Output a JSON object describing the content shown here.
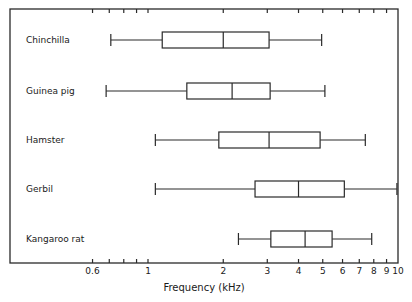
{
  "chart_data": {
    "type": "boxplot",
    "title": "",
    "xlabel": "Frequency (kHz)",
    "ylabel": "",
    "xscale": "log",
    "xlim": [
      0.45,
      10
    ],
    "grid": false,
    "legend": null,
    "x_ticks": [
      0.6,
      0.7,
      0.8,
      0.9,
      1,
      2,
      3,
      4,
      5,
      6,
      7,
      8,
      9,
      10
    ],
    "x_tick_labels": [
      {
        "value": 0.6,
        "label": "0.6"
      },
      {
        "value": 1,
        "label": "1"
      },
      {
        "value": 2,
        "label": "2"
      },
      {
        "value": 3,
        "label": "3"
      },
      {
        "value": 4,
        "label": "4"
      },
      {
        "value": 5,
        "label": "5"
      },
      {
        "value": 6,
        "label": "6"
      },
      {
        "value": 7,
        "label": "7"
      },
      {
        "value": 8,
        "label": "8"
      },
      {
        "value": 9,
        "label": "9"
      },
      {
        "value": 10,
        "label": "10"
      }
    ],
    "categories": [
      "Chinchilla",
      "Guinea pig",
      "Hamster",
      "Gerbil",
      "Kangaroo rat"
    ],
    "series": [
      {
        "name": "Chinchilla",
        "whisker_low": 0.71,
        "q1": 1.14,
        "median": 2.0,
        "q3": 3.05,
        "whisker_high": 4.95
      },
      {
        "name": "Guinea pig",
        "whisker_low": 0.68,
        "q1": 1.43,
        "median": 2.17,
        "q3": 3.08,
        "whisker_high": 5.1
      },
      {
        "name": "Hamster",
        "whisker_low": 1.07,
        "q1": 1.92,
        "median": 3.05,
        "q3": 4.88,
        "whisker_high": 7.4
      },
      {
        "name": "Gerbil",
        "whisker_low": 1.07,
        "q1": 2.68,
        "median": 4.0,
        "q3": 6.1,
        "whisker_high": 9.9
      },
      {
        "name": "Kangaroo rat",
        "whisker_low": 2.3,
        "q1": 3.1,
        "median": 4.25,
        "q3": 5.45,
        "whisker_high": 7.85
      }
    ]
  }
}
